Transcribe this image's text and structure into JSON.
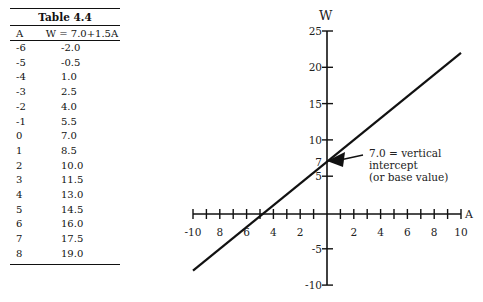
{
  "table": {
    "caption": "Table 4.4",
    "headers": [
      "A",
      "W = 7.0+1.5A"
    ],
    "rows": [
      [
        "-6",
        "-2.0"
      ],
      [
        "-5",
        "-0.5"
      ],
      [
        "-4",
        "1.0"
      ],
      [
        "-3",
        "2.5"
      ],
      [
        "-2",
        "4.0"
      ],
      [
        "-1",
        "5.5"
      ],
      [
        "0",
        "7.0"
      ],
      [
        "1",
        "8.5"
      ],
      [
        "2",
        "10.0"
      ],
      [
        "3",
        "11.5"
      ],
      [
        "4",
        "13.0"
      ],
      [
        "5",
        "14.5"
      ],
      [
        "6",
        "16.0"
      ],
      [
        "7",
        "17.5"
      ],
      [
        "8",
        "19.0"
      ]
    ]
  },
  "chart": {
    "y_axis_label": "W",
    "x_axis_label": "A",
    "y_tick_labels": [
      "25",
      "20",
      "15",
      "10",
      "7",
      "5",
      "-5",
      "-10"
    ],
    "x_tick_labels_left": [
      "-10",
      "8",
      "6",
      "4",
      "2"
    ],
    "x_tick_labels_right": [
      "2",
      "4",
      "6",
      "8",
      "10"
    ],
    "annotation": [
      "7.0 = vertical",
      "intercept",
      "(or base value)"
    ]
  },
  "chart_data": {
    "type": "line",
    "title": "Table 4.4",
    "equation": "W = 7.0+1.5A",
    "xlabel": "A",
    "ylabel": "W",
    "xlim": [
      -10,
      10
    ],
    "ylim": [
      -10,
      25
    ],
    "x_ticks": [
      -10,
      -8,
      -6,
      -4,
      -2,
      2,
      4,
      6,
      8,
      10
    ],
    "y_ticks": [
      -10,
      -5,
      5,
      7,
      10,
      15,
      20,
      25
    ],
    "series": [
      {
        "name": "W = 7.0+1.5A",
        "x": [
          -10,
          10
        ],
        "y": [
          -8.0,
          22.0
        ]
      }
    ],
    "table_points": {
      "A": [
        -6,
        -5,
        -4,
        -3,
        -2,
        -1,
        0,
        1,
        2,
        3,
        4,
        5,
        6,
        7,
        8
      ],
      "W": [
        -2.0,
        -0.5,
        1.0,
        2.5,
        4.0,
        5.5,
        7.0,
        8.5,
        10.0,
        11.5,
        13.0,
        14.5,
        16.0,
        17.5,
        19.0
      ]
    },
    "annotations": [
      {
        "text": "7.0 = vertical intercept (or base value)",
        "x": 0,
        "y": 7
      }
    ],
    "grid": false,
    "legend": "none"
  }
}
